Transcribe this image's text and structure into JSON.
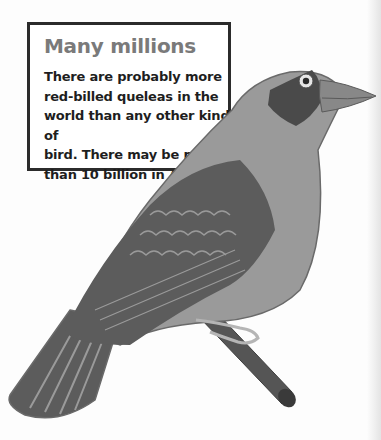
{
  "info_box": {
    "title": "Many millions",
    "body_lines": [
      "There are probably more",
      "red-billed queleas in the",
      "world than any other kind of",
      "bird. There may be more",
      "than 10 billion in Africa."
    ]
  },
  "illustration": {
    "subject": "red-billed quelea perched on a branch",
    "colors": {
      "body": "#9a9a9a",
      "wing_dark": "#5c5c5c",
      "mask": "#4a4a4a",
      "branch": "#555555",
      "outline": "#6a6a6a"
    }
  }
}
